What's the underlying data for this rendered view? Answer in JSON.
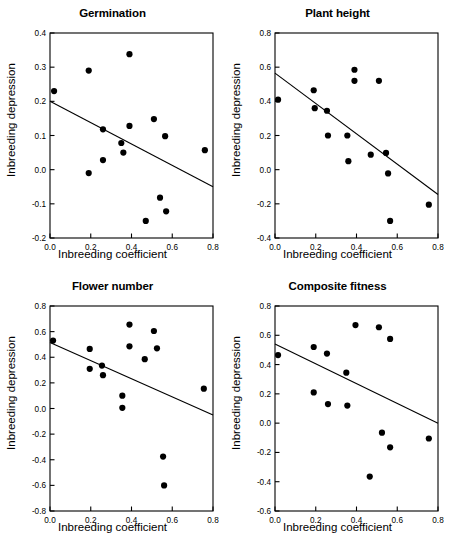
{
  "figure": {
    "axis_labels": {
      "x": "Inbreeding coefficient",
      "y": "Inbreeding depression"
    }
  },
  "chart_data": [
    {
      "type": "scatter",
      "title": "Germination",
      "xlabel": "Inbreeding coefficient",
      "ylabel": "Inbreeding depression",
      "xlim": [
        0.0,
        0.8
      ],
      "ylim": [
        -0.2,
        0.4
      ],
      "xticks": [
        "0.0",
        "0.2",
        "0.4",
        "0.6",
        "0.8"
      ],
      "xtickvals": [
        0.0,
        0.2,
        0.4,
        0.6,
        0.8
      ],
      "yticks": [
        "0.4",
        "0.3",
        "0.2",
        "0.1",
        "0.0",
        "-0.1",
        "-0.2"
      ],
      "ytickvals": [
        0.4,
        0.3,
        0.2,
        0.1,
        0.0,
        -0.1,
        -0.2
      ],
      "grid": false,
      "legend": "none",
      "points": [
        {
          "x": 0.02,
          "y": 0.23
        },
        {
          "x": 0.19,
          "y": 0.29
        },
        {
          "x": 0.19,
          "y": -0.01
        },
        {
          "x": 0.26,
          "y": 0.118
        },
        {
          "x": 0.26,
          "y": 0.028
        },
        {
          "x": 0.35,
          "y": 0.078
        },
        {
          "x": 0.36,
          "y": 0.05
        },
        {
          "x": 0.39,
          "y": 0.338
        },
        {
          "x": 0.39,
          "y": 0.128
        },
        {
          "x": 0.47,
          "y": -0.15
        },
        {
          "x": 0.51,
          "y": 0.148
        },
        {
          "x": 0.54,
          "y": -0.082
        },
        {
          "x": 0.565,
          "y": 0.098
        },
        {
          "x": 0.57,
          "y": -0.122
        },
        {
          "x": 0.76,
          "y": 0.057
        }
      ],
      "regression_line": {
        "x0": 0.0,
        "y0": 0.2,
        "x1": 0.8,
        "y1": -0.05
      }
    },
    {
      "type": "scatter",
      "title": "Plant height",
      "xlabel": "Inbreeding coefficient",
      "ylabel": "Inbreeding depression",
      "xlim": [
        0.0,
        0.8
      ],
      "ylim": [
        -0.4,
        0.8
      ],
      "xticks": [
        "0.0",
        "0.2",
        "0.4",
        "0.6",
        "0.8"
      ],
      "xtickvals": [
        0.0,
        0.2,
        0.4,
        0.6,
        0.8
      ],
      "yticks": [
        "0.8",
        "0.6",
        "0.4",
        "0.2",
        "0.0",
        "-0.2",
        "-0.4"
      ],
      "ytickvals": [
        0.8,
        0.6,
        0.4,
        0.2,
        0.0,
        -0.2,
        -0.4
      ],
      "grid": false,
      "legend": "none",
      "points": [
        {
          "x": 0.015,
          "y": 0.41
        },
        {
          "x": 0.19,
          "y": 0.465
        },
        {
          "x": 0.195,
          "y": 0.36
        },
        {
          "x": 0.255,
          "y": 0.345
        },
        {
          "x": 0.26,
          "y": 0.2
        },
        {
          "x": 0.355,
          "y": 0.2
        },
        {
          "x": 0.36,
          "y": 0.05
        },
        {
          "x": 0.39,
          "y": 0.585
        },
        {
          "x": 0.39,
          "y": 0.52
        },
        {
          "x": 0.47,
          "y": 0.088
        },
        {
          "x": 0.51,
          "y": 0.52
        },
        {
          "x": 0.545,
          "y": 0.098
        },
        {
          "x": 0.555,
          "y": -0.022
        },
        {
          "x": 0.565,
          "y": -0.3
        },
        {
          "x": 0.755,
          "y": -0.205
        }
      ],
      "regression_line": {
        "x0": 0.0,
        "y0": 0.565,
        "x1": 0.8,
        "y1": -0.145
      }
    },
    {
      "type": "scatter",
      "title": "Flower number",
      "xlabel": "Inbreeding coefficient",
      "ylabel": "Inbreeding depression",
      "xlim": [
        0.0,
        0.8
      ],
      "ylim": [
        -0.8,
        0.8
      ],
      "xticks": [
        "0.0",
        "0.2",
        "0.4",
        "0.6",
        "0.8"
      ],
      "xtickvals": [
        0.0,
        0.2,
        0.4,
        0.6,
        0.8
      ],
      "yticks": [
        "0.8",
        "0.6",
        "0.4",
        "0.2",
        "0.0",
        "-0.2",
        "-0.4",
        "-0.6",
        "-0.8"
      ],
      "ytickvals": [
        0.8,
        0.6,
        0.4,
        0.2,
        0.0,
        -0.2,
        -0.4,
        -0.6,
        -0.8
      ],
      "grid": false,
      "legend": "none",
      "points": [
        {
          "x": 0.015,
          "y": 0.53
        },
        {
          "x": 0.195,
          "y": 0.465
        },
        {
          "x": 0.195,
          "y": 0.31
        },
        {
          "x": 0.255,
          "y": 0.335
        },
        {
          "x": 0.26,
          "y": 0.26
        },
        {
          "x": 0.355,
          "y": 0.1
        },
        {
          "x": 0.355,
          "y": 0.005
        },
        {
          "x": 0.39,
          "y": 0.655
        },
        {
          "x": 0.39,
          "y": 0.485
        },
        {
          "x": 0.465,
          "y": 0.385
        },
        {
          "x": 0.51,
          "y": 0.605
        },
        {
          "x": 0.525,
          "y": 0.47
        },
        {
          "x": 0.555,
          "y": -0.375
        },
        {
          "x": 0.56,
          "y": -0.6
        },
        {
          "x": 0.755,
          "y": 0.155
        }
      ],
      "regression_line": {
        "x0": 0.0,
        "y0": 0.515,
        "x1": 0.8,
        "y1": -0.05
      }
    },
    {
      "type": "scatter",
      "title": "Composite fitness",
      "xlabel": "Inbreeding coefficient",
      "ylabel": "Inbreeding depression",
      "xlim": [
        0.0,
        0.8
      ],
      "ylim": [
        -0.6,
        0.8
      ],
      "xticks": [
        "0.0",
        "0.2",
        "0.4",
        "0.6",
        "0.8"
      ],
      "xtickvals": [
        0.0,
        0.2,
        0.4,
        0.6,
        0.8
      ],
      "yticks": [
        "0.8",
        "0.6",
        "0.4",
        "0.2",
        "0.0",
        "-0.2",
        "-0.4",
        "-0.6"
      ],
      "ytickvals": [
        0.8,
        0.6,
        0.4,
        0.2,
        0.0,
        -0.2,
        -0.4,
        -0.6
      ],
      "grid": false,
      "legend": "none",
      "points": [
        {
          "x": 0.015,
          "y": 0.465
        },
        {
          "x": 0.19,
          "y": 0.52
        },
        {
          "x": 0.19,
          "y": 0.21
        },
        {
          "x": 0.255,
          "y": 0.475
        },
        {
          "x": 0.26,
          "y": 0.13
        },
        {
          "x": 0.35,
          "y": 0.345
        },
        {
          "x": 0.355,
          "y": 0.12
        },
        {
          "x": 0.395,
          "y": 0.67
        },
        {
          "x": 0.465,
          "y": -0.365
        },
        {
          "x": 0.51,
          "y": 0.655
        },
        {
          "x": 0.525,
          "y": -0.065
        },
        {
          "x": 0.565,
          "y": 0.575
        },
        {
          "x": 0.565,
          "y": -0.165
        },
        {
          "x": 0.755,
          "y": -0.105
        }
      ],
      "regression_line": {
        "x0": 0.0,
        "y0": 0.54,
        "x1": 0.8,
        "y1": 0.0
      }
    }
  ]
}
